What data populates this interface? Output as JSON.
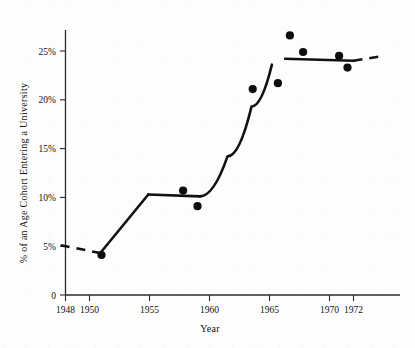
{
  "chart_data": {
    "type": "scatter",
    "title": "",
    "subtitle": "",
    "xlabel": "Year",
    "ylabel": "% of an Age Cohort Entering a University",
    "xlim": [
      1946.5,
      1975.5
    ],
    "ylim": [
      0,
      28
    ],
    "grid": false,
    "legend": null,
    "x_ticks": [
      1948,
      1950,
      1955,
      1960,
      1965,
      1970,
      1972
    ],
    "x_tick_labels": [
      "1948",
      "1950",
      "1955",
      "1960",
      "1965",
      "1970",
      "1972"
    ],
    "y_ticks": [
      0,
      5,
      10,
      15,
      20,
      25
    ],
    "y_tick_labels": [
      "0",
      "5%",
      "10%",
      "15%",
      "20%",
      "25%"
    ],
    "points": [
      {
        "x": 1951.0,
        "y": 4.1
      },
      {
        "x": 1957.8,
        "y": 10.7
      },
      {
        "x": 1959.0,
        "y": 9.1
      },
      {
        "x": 1963.6,
        "y": 21.1
      },
      {
        "x": 1965.7,
        "y": 21.7
      },
      {
        "x": 1966.7,
        "y": 26.6
      },
      {
        "x": 1967.8,
        "y": 24.9
      },
      {
        "x": 1970.8,
        "y": 24.5
      },
      {
        "x": 1971.5,
        "y": 23.3
      }
    ],
    "series": [
      {
        "name": "Fitted trend (dashed extrapolation)",
        "style": "dashed",
        "x": [
          1947.6,
          1950.9
        ],
        "values": [
          5.1,
          4.3
        ]
      },
      {
        "name": "Fitted trend (rise to plateau 1951-1955)",
        "style": "solid",
        "x": [
          1950.9,
          1954.9
        ],
        "values": [
          4.3,
          10.3
        ]
      },
      {
        "name": "Fitted trend (plateau 1955-1959)",
        "style": "solid",
        "x": [
          1954.9,
          1959.2
        ],
        "values": [
          10.3,
          10.1
        ]
      },
      {
        "name": "Fitted trend (steep rise 1959-1965)",
        "style": "solid",
        "x": [
          1959.2,
          1961.5,
          1963.5,
          1965.2
        ],
        "values": [
          10.1,
          14.2,
          19.3,
          23.6
        ]
      },
      {
        "name": "Fitted trend (plateau 1966-1972)",
        "style": "solid",
        "x": [
          1966.3,
          1972.0
        ],
        "values": [
          24.2,
          24.0
        ]
      },
      {
        "name": "Fitted trend (dashed extrapolation right)",
        "style": "dashed",
        "x": [
          1972.0,
          1974.5
        ],
        "values": [
          24.0,
          24.5
        ]
      }
    ]
  },
  "axes": {
    "y_axis_title": "% of an Age Cohort Entering a University",
    "x_axis_title": "Year"
  },
  "colors": {
    "ink": "#111111",
    "axis": "#2b2b2b",
    "background": "#fdfdfd"
  }
}
